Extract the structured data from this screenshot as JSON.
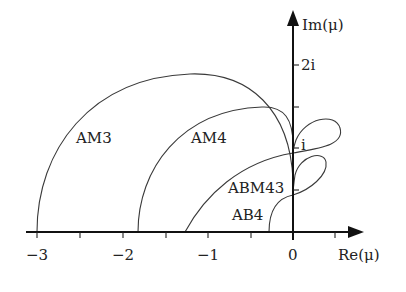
{
  "figure": {
    "type": "stability-region-diagram",
    "axes": {
      "x_label": "Re(μ)",
      "y_label": "Im(μ)",
      "x_tick_labels": [
        "−3",
        "−2",
        "−1",
        "0"
      ],
      "y_tick_labels": [
        "i",
        "2i"
      ]
    },
    "curves": [
      {
        "label": "AM3"
      },
      {
        "label": "AM4"
      },
      {
        "label": "ABM43"
      },
      {
        "label": "AB4"
      }
    ],
    "colors": {
      "curve": "#3a3a3a",
      "axis": "#111111",
      "background": "#ffffff"
    }
  }
}
